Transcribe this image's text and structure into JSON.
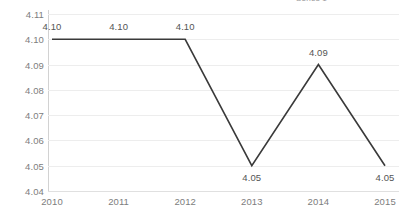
{
  "chart_data": {
    "type": "line",
    "title": "",
    "subtitle": "",
    "xlabel": "",
    "ylabel": "",
    "categories": [
      "2010",
      "2011",
      "2012",
      "2013",
      "2014",
      "2015"
    ],
    "values": [
      4.1,
      4.1,
      4.1,
      4.05,
      4.09,
      4.05
    ],
    "point_labels": [
      "4.10",
      "4.10",
      "4.10",
      "4.05",
      "4.09",
      "4.05"
    ],
    "label_positions": [
      "above",
      "above",
      "above",
      "below",
      "above",
      "below"
    ],
    "series": [
      {
        "name": "",
        "values": [
          4.1,
          4.1,
          4.1,
          4.05,
          4.09,
          4.05
        ],
        "color": "#3a3a3a"
      }
    ],
    "ylim": [
      4.04,
      4.11
    ],
    "ytick_step": 0.01,
    "ytick_labels": [
      "4.11",
      "4.10",
      "4.09",
      "4.08",
      "4.07",
      "4.06",
      "4.05",
      "4.04"
    ],
    "ytick_values": [
      4.11,
      4.1,
      4.09,
      4.08,
      4.07,
      4.06,
      4.05,
      4.04
    ],
    "xtick_labels": [
      "2010",
      "2011",
      "2012",
      "2013",
      "2014",
      "2015"
    ],
    "grid": true,
    "grid_axis": "y",
    "legend": false,
    "legend_position": "top-right",
    "markers": false
  },
  "colors": {
    "line": "#3a3a3a",
    "gridline": "#ededed",
    "baseline": "#e0e0e0",
    "axis": "#d2d2d2",
    "tick_text": "#7d7d7d",
    "value_text": "#555555",
    "background": "#ffffff"
  },
  "legend_fragment": {
    "text": "Series 1"
  }
}
